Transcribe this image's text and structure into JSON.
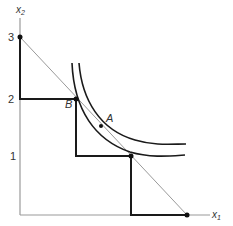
{
  "diagram": {
    "axes": {
      "y_label": "x",
      "y_label_sub": "2",
      "x_label": "x",
      "x_label_sub": "1"
    },
    "ticks": {
      "y3": "3",
      "y2": "2",
      "y1": "1"
    },
    "points": {
      "A": "A",
      "B": "B"
    },
    "colors": {
      "axis": "#999999",
      "budget_line": "#999999",
      "staircase": "#1a1a1a",
      "indifference_curve": "#1a1a1a",
      "point": "#111111"
    }
  }
}
